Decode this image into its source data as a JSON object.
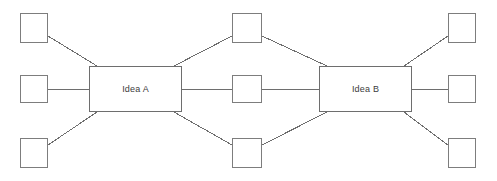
{
  "diagram": {
    "type": "node-link-diagram",
    "canvas": {
      "width": 497,
      "height": 181,
      "background": "#ffffff"
    },
    "style": {
      "node_stroke": "#7d7d7d",
      "idea_stroke": "#6e6e6e",
      "edge_stroke": "#6e6e6e",
      "node_fill": "#ffffff",
      "label_color": "#3c3c3c",
      "stroke_width": 1
    },
    "idea_nodes": [
      {
        "id": "idea-a",
        "label": "Idea A",
        "x": 89,
        "y": 66,
        "width": 93,
        "height": 46
      },
      {
        "id": "idea-b",
        "label": "Idea B",
        "x": 319,
        "y": 66,
        "width": 93,
        "height": 46
      }
    ],
    "satellite_nodes": [
      {
        "id": "left-top",
        "label": "",
        "x": 20,
        "y": 13,
        "width": 28,
        "height": 30,
        "column": "left",
        "row": "top"
      },
      {
        "id": "left-middle",
        "label": "",
        "x": 20,
        "y": 75,
        "width": 28,
        "height": 28,
        "column": "left",
        "row": "middle"
      },
      {
        "id": "left-bottom",
        "label": "",
        "x": 20,
        "y": 138,
        "width": 28,
        "height": 30,
        "column": "left",
        "row": "bottom"
      },
      {
        "id": "center-top",
        "label": "",
        "x": 232,
        "y": 13,
        "width": 30,
        "height": 30,
        "column": "center",
        "row": "top"
      },
      {
        "id": "center-middle",
        "label": "",
        "x": 232,
        "y": 75,
        "width": 30,
        "height": 28,
        "column": "center",
        "row": "middle"
      },
      {
        "id": "center-bottom",
        "label": "",
        "x": 232,
        "y": 138,
        "width": 30,
        "height": 30,
        "column": "center",
        "row": "bottom"
      },
      {
        "id": "right-top",
        "label": "",
        "x": 448,
        "y": 13,
        "width": 28,
        "height": 30,
        "column": "right",
        "row": "top"
      },
      {
        "id": "right-middle",
        "label": "",
        "x": 448,
        "y": 75,
        "width": 28,
        "height": 28,
        "column": "right",
        "row": "middle"
      },
      {
        "id": "right-bottom",
        "label": "",
        "x": 448,
        "y": 138,
        "width": 28,
        "height": 30,
        "column": "right",
        "row": "bottom"
      }
    ],
    "edges": [
      {
        "from": "left-top",
        "to": "idea-a",
        "x1": 48,
        "y1": 36,
        "x2": 97,
        "y2": 66
      },
      {
        "from": "left-middle",
        "to": "idea-a",
        "x1": 48,
        "y1": 89,
        "x2": 89,
        "y2": 89
      },
      {
        "from": "left-bottom",
        "to": "idea-a",
        "x1": 48,
        "y1": 145,
        "x2": 97,
        "y2": 112
      },
      {
        "from": "idea-a",
        "to": "center-top",
        "x1": 174,
        "y1": 66,
        "x2": 232,
        "y2": 36
      },
      {
        "from": "idea-a",
        "to": "center-middle",
        "x1": 182,
        "y1": 89,
        "x2": 232,
        "y2": 89
      },
      {
        "from": "idea-a",
        "to": "center-bottom",
        "x1": 174,
        "y1": 112,
        "x2": 232,
        "y2": 145
      },
      {
        "from": "center-top",
        "to": "idea-b",
        "x1": 262,
        "y1": 36,
        "x2": 327,
        "y2": 66
      },
      {
        "from": "center-middle",
        "to": "idea-b",
        "x1": 262,
        "y1": 89,
        "x2": 319,
        "y2": 89
      },
      {
        "from": "center-bottom",
        "to": "idea-b",
        "x1": 262,
        "y1": 145,
        "x2": 327,
        "y2": 112
      },
      {
        "from": "idea-b",
        "to": "right-top",
        "x1": 404,
        "y1": 66,
        "x2": 448,
        "y2": 36
      },
      {
        "from": "idea-b",
        "to": "right-middle",
        "x1": 412,
        "y1": 89,
        "x2": 448,
        "y2": 89
      },
      {
        "from": "idea-b",
        "to": "right-bottom",
        "x1": 404,
        "y1": 112,
        "x2": 448,
        "y2": 145
      }
    ]
  }
}
